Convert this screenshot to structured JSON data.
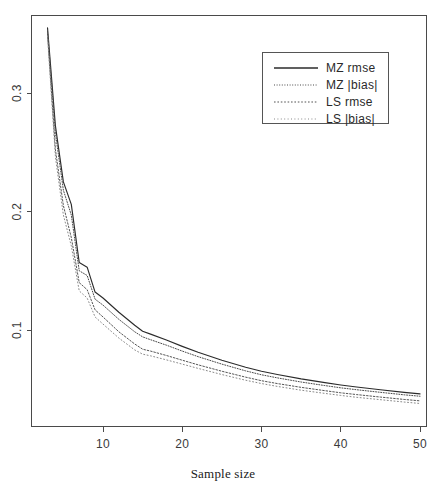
{
  "chart_data": {
    "type": "line",
    "title": "",
    "subtitle": "",
    "xlabel": "Sample size",
    "ylabel": "",
    "xlim": [
      2,
      50
    ],
    "ylim": [
      0.025,
      0.365
    ],
    "grid": false,
    "legend_position": "top-right",
    "xticks": [
      10,
      20,
      30,
      40,
      50
    ],
    "xtick_labels": [
      "10",
      "20",
      "30",
      "40",
      "50"
    ],
    "yticks": [
      0.1,
      0.2,
      0.3
    ],
    "ytick_labels": [
      "0.1",
      "0.2",
      "0.3"
    ],
    "x": [
      3,
      4,
      5,
      6,
      7,
      8,
      9,
      10,
      12,
      14,
      15,
      16,
      18,
      20,
      22,
      25,
      28,
      30,
      32,
      35,
      38,
      40,
      42,
      45,
      48,
      50
    ],
    "series": [
      {
        "name": "MZ rmse",
        "style": "solid",
        "color": "#2b2b2b",
        "values": [
          0.355,
          0.272,
          0.225,
          0.206,
          0.157,
          0.153,
          0.132,
          0.127,
          0.115,
          0.104,
          0.099,
          0.0965,
          0.0915,
          0.0862,
          0.0812,
          0.0745,
          0.0686,
          0.0652,
          0.0625,
          0.0588,
          0.0556,
          0.0536,
          0.0519,
          0.0496,
          0.0474,
          0.0461
        ]
      },
      {
        "name": "MZ |bias|",
        "style": "dotted-fine",
        "color": "#4a4a4a",
        "values": [
          0.352,
          0.266,
          0.218,
          0.197,
          0.15,
          0.146,
          0.126,
          0.121,
          0.109,
          0.0985,
          0.0942,
          0.0918,
          0.0872,
          0.0822,
          0.0775,
          0.0712,
          0.0655,
          0.0622,
          0.0596,
          0.0561,
          0.0531,
          0.0512,
          0.0496,
          0.0474,
          0.0453,
          0.0441
        ]
      },
      {
        "name": "LS rmse",
        "style": "dotted-coarse",
        "color": "#555555",
        "values": [
          0.35,
          0.252,
          0.205,
          0.178,
          0.14,
          0.134,
          0.117,
          0.111,
          0.0985,
          0.0882,
          0.0838,
          0.0822,
          0.0785,
          0.0745,
          0.0706,
          0.0652,
          0.0602,
          0.0572,
          0.0548,
          0.0516,
          0.0488,
          0.047,
          0.0455,
          0.0434,
          0.0414,
          0.0402
        ]
      },
      {
        "name": "LS |bias|",
        "style": "dotted-light",
        "color": "#8a8a8a",
        "values": [
          0.348,
          0.246,
          0.197,
          0.171,
          0.133,
          0.127,
          0.111,
          0.105,
          0.0932,
          0.0832,
          0.0796,
          0.0782,
          0.0748,
          0.0712,
          0.0676,
          0.0624,
          0.0576,
          0.0548,
          0.0524,
          0.0492,
          0.0465,
          0.0448,
          0.0432,
          0.0412,
          0.0392,
          0.038
        ]
      }
    ]
  },
  "legend": {
    "entries": [
      {
        "label": "MZ rmse"
      },
      {
        "label": "MZ |bias|"
      },
      {
        "label": "LS rmse"
      },
      {
        "label": "LS |bias|"
      }
    ]
  },
  "axes": {
    "x_title": "Sample size",
    "x_tick_labels": [
      "10",
      "20",
      "30",
      "40",
      "50"
    ],
    "y_tick_labels": [
      "0.1",
      "0.2",
      "0.3"
    ]
  }
}
